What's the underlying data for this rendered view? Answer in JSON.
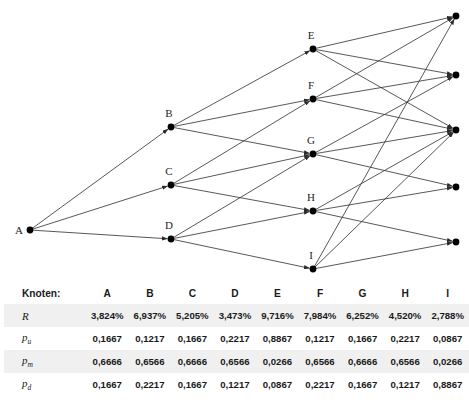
{
  "figure": {
    "type": "diagram",
    "subtype": "trinomial-lattice",
    "edge_color": "#3a3a3a",
    "node_color": "#000000"
  },
  "graph": {
    "nodes": [
      {
        "id": "A",
        "label": "A",
        "x": 30,
        "y": 230,
        "label_dx": -11,
        "label_dy": 4,
        "labelled": true
      },
      {
        "id": "B",
        "label": "B",
        "x": 171,
        "y": 127,
        "label_dx": -2,
        "label_dy": -10,
        "labelled": true
      },
      {
        "id": "C",
        "label": "C",
        "x": 171,
        "y": 185,
        "label_dx": -2,
        "label_dy": -10,
        "labelled": true
      },
      {
        "id": "D",
        "label": "D",
        "x": 171,
        "y": 239,
        "label_dx": -2,
        "label_dy": -10,
        "labelled": true
      },
      {
        "id": "E",
        "label": "E",
        "x": 313,
        "y": 49,
        "label_dx": -2,
        "label_dy": -10,
        "labelled": true
      },
      {
        "id": "F",
        "label": "F",
        "x": 313,
        "y": 99,
        "label_dx": -2,
        "label_dy": -10,
        "labelled": true
      },
      {
        "id": "G",
        "label": "G",
        "x": 313,
        "y": 154,
        "label_dx": -2,
        "label_dy": -10,
        "labelled": true
      },
      {
        "id": "H",
        "label": "H",
        "x": 313,
        "y": 211,
        "label_dx": -2,
        "label_dy": -10,
        "labelled": true
      },
      {
        "id": "I",
        "label": "I",
        "x": 313,
        "y": 269,
        "label_dx": -2,
        "label_dy": -10,
        "labelled": true
      },
      {
        "id": "T1",
        "label": "",
        "x": 456,
        "y": 16,
        "label_dx": 0,
        "label_dy": 0,
        "labelled": false
      },
      {
        "id": "T2",
        "label": "",
        "x": 456,
        "y": 75,
        "label_dx": 0,
        "label_dy": 0,
        "labelled": false
      },
      {
        "id": "T3",
        "label": "",
        "x": 456,
        "y": 130,
        "label_dx": 0,
        "label_dy": 0,
        "labelled": false
      },
      {
        "id": "T4",
        "label": "",
        "x": 456,
        "y": 187,
        "label_dx": 0,
        "label_dy": 0,
        "labelled": false
      },
      {
        "id": "T5",
        "label": "",
        "x": 456,
        "y": 242,
        "label_dx": 0,
        "label_dy": 0,
        "labelled": false
      }
    ],
    "edges": [
      {
        "from": "A",
        "to": "B"
      },
      {
        "from": "A",
        "to": "C"
      },
      {
        "from": "A",
        "to": "D"
      },
      {
        "from": "B",
        "to": "E"
      },
      {
        "from": "B",
        "to": "F"
      },
      {
        "from": "B",
        "to": "G"
      },
      {
        "from": "C",
        "to": "F"
      },
      {
        "from": "C",
        "to": "G"
      },
      {
        "from": "C",
        "to": "H"
      },
      {
        "from": "D",
        "to": "G"
      },
      {
        "from": "D",
        "to": "H"
      },
      {
        "from": "D",
        "to": "I"
      },
      {
        "from": "E",
        "to": "T1"
      },
      {
        "from": "E",
        "to": "T2"
      },
      {
        "from": "E",
        "to": "T3"
      },
      {
        "from": "F",
        "to": "T1"
      },
      {
        "from": "F",
        "to": "T2"
      },
      {
        "from": "F",
        "to": "T3"
      },
      {
        "from": "G",
        "to": "T2"
      },
      {
        "from": "G",
        "to": "T3"
      },
      {
        "from": "G",
        "to": "T4"
      },
      {
        "from": "H",
        "to": "T3"
      },
      {
        "from": "H",
        "to": "T4"
      },
      {
        "from": "H",
        "to": "T5"
      },
      {
        "from": "I",
        "to": "T1"
      },
      {
        "from": "I",
        "to": "T3"
      },
      {
        "from": "I",
        "to": "T5"
      }
    ]
  },
  "table": {
    "row_header_label": "Knoten:",
    "columns": [
      "A",
      "B",
      "C",
      "D",
      "E",
      "F",
      "G",
      "H",
      "I"
    ],
    "rows": [
      {
        "symbol": "R",
        "symbol_sub": "",
        "shaded": true,
        "values": [
          "3,824%",
          "6,937%",
          "5,205%",
          "3,473%",
          "9,716%",
          "7,984%",
          "6,252%",
          "4,520%",
          "2,788%"
        ]
      },
      {
        "symbol": "p",
        "symbol_sub": "u",
        "shaded": false,
        "values": [
          "0,1667",
          "0,1217",
          "0,1667",
          "0,2217",
          "0,8867",
          "0,1217",
          "0,1667",
          "0,2217",
          "0,0867"
        ]
      },
      {
        "symbol": "p",
        "symbol_sub": "m",
        "shaded": true,
        "values": [
          "0,6666",
          "0,6566",
          "0,6666",
          "0,6566",
          "0,0266",
          "0,6566",
          "0,6666",
          "0,6566",
          "0,0266"
        ]
      },
      {
        "symbol": "p",
        "symbol_sub": "d",
        "shaded": false,
        "values": [
          "0,1667",
          "0,2217",
          "0,1667",
          "0,1217",
          "0,0867",
          "0,2217",
          "0,1667",
          "0,1217",
          "0,8867"
        ]
      }
    ]
  }
}
